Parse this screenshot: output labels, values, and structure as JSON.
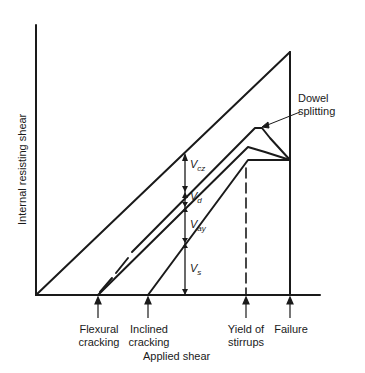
{
  "axes": {
    "x_label": "Applied shear",
    "y_label": "Internal resisting shear"
  },
  "events": [
    {
      "id": "flexural",
      "line1": "Flexural",
      "line2": "cracking"
    },
    {
      "id": "inclined",
      "line1": "Inclined",
      "line2": "cracking"
    },
    {
      "id": "yield",
      "line1": "Yield of",
      "line2": "stirrups"
    },
    {
      "id": "failure",
      "line1": "Failure",
      "line2": ""
    }
  ],
  "components": [
    {
      "symbol": "V",
      "sub": "cz"
    },
    {
      "symbol": "V",
      "sub": "d"
    },
    {
      "symbol": "V",
      "sub": "ay"
    },
    {
      "symbol": "V",
      "sub": "s"
    }
  ],
  "annotation": {
    "line1": "Dowel",
    "line2": "splitting"
  },
  "colors": {
    "line": "#1a1a1a",
    "background": "#ffffff"
  }
}
